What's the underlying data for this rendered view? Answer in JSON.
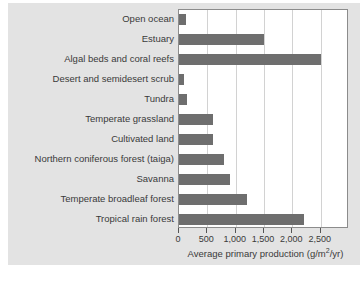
{
  "chart_data": {
    "type": "bar",
    "orientation": "horizontal",
    "title": "",
    "xlabel": "Average primary production (g/m²/yr)",
    "ylabel": "",
    "xlim": [
      0,
      3000
    ],
    "xticks": [
      0,
      500,
      1000,
      1500,
      2000,
      2500
    ],
    "xticklabels": [
      "0",
      "500",
      "1,000",
      "1,500",
      "2,000",
      "2,500"
    ],
    "grid": "vertical",
    "legend": "none",
    "bar_color": "#6e6e6e",
    "plot_background": "#ffffff",
    "panel_background": "#e3e3e3",
    "gridline_color": "#d2d2d2",
    "axis_color": "#8c8c8c",
    "categories": [
      "Open ocean",
      "Estuary",
      "Algal beds and coral reefs",
      "Desert and semidesert scrub",
      "Tundra",
      "Temperate grassland",
      "Cultivated land",
      "Northern coniferous forest (taiga)",
      "Savanna",
      "Temperate broadleaf forest",
      "Tropical rain forest"
    ],
    "values": [
      125,
      1500,
      2500,
      90,
      140,
      600,
      600,
      800,
      900,
      1200,
      2200
    ],
    "units": "g/m²/yr",
    "axis_title_parts": {
      "prefix": "Average primary production (g/m",
      "sup": "2",
      "suffix": "/yr)"
    }
  }
}
